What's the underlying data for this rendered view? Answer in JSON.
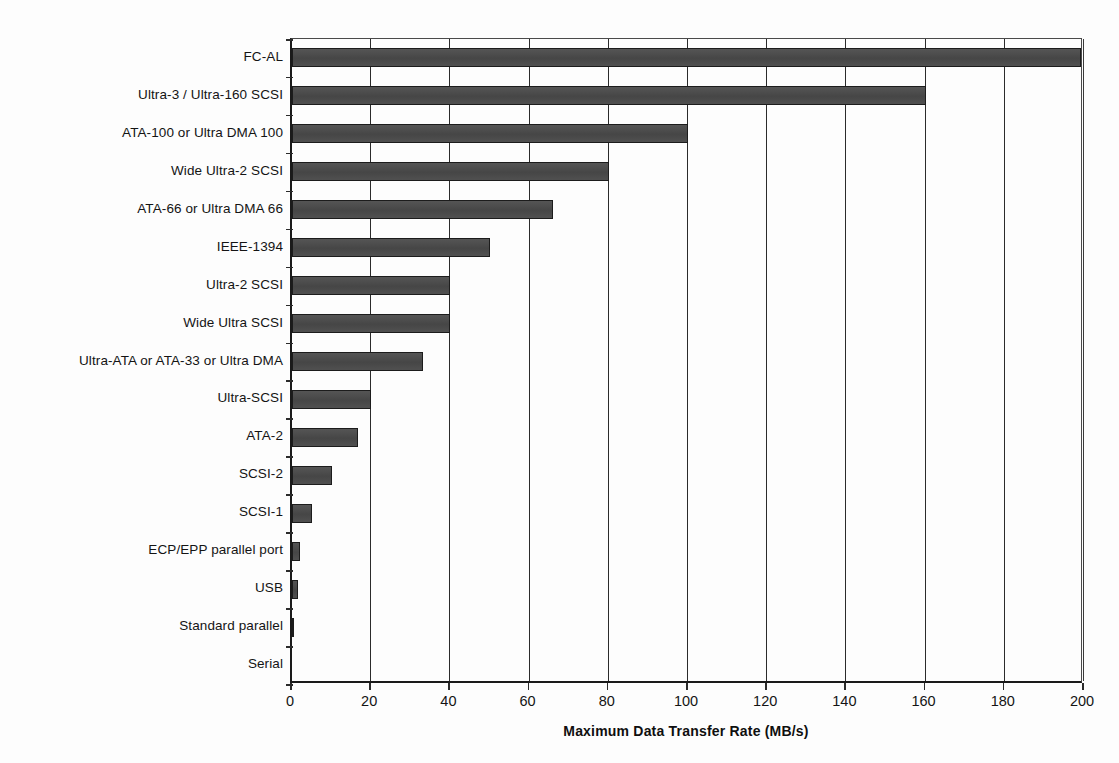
{
  "chart_data": {
    "type": "bar",
    "orientation": "horizontal",
    "title": "",
    "xlabel": "Maximum Data Transfer Rate (MB/s)",
    "ylabel": "",
    "xlim": [
      0,
      200
    ],
    "xticks": [
      0,
      20,
      40,
      60,
      80,
      100,
      120,
      140,
      160,
      180,
      200
    ],
    "grid": "vertical",
    "legend": "none",
    "bar_color": "#4d4d4d",
    "bar_edge_color": "#1c1c1c",
    "background_color": "#fdfdfd",
    "axis_color": "#1a1a1a",
    "categories": [
      "FC-AL",
      "Ultra-3 / Ultra-160 SCSI",
      "ATA-100 or Ultra DMA 100",
      "Wide Ultra-2 SCSI",
      "ATA-66 or Ultra DMA 66",
      "IEEE-1394",
      "Ultra-2 SCSI",
      "Wide Ultra SCSI",
      "Ultra-ATA or ATA-33 or Ultra DMA",
      "Ultra-SCSI",
      "ATA-2",
      "SCSI-2",
      "SCSI-1",
      "ECP/EPP parallel port",
      "USB",
      "Standard parallel",
      "Serial"
    ],
    "values": [
      200,
      160,
      100,
      80,
      66,
      50,
      40,
      40,
      33,
      20,
      16.6,
      10,
      5,
      2,
      1.5,
      0.3,
      0
    ]
  }
}
